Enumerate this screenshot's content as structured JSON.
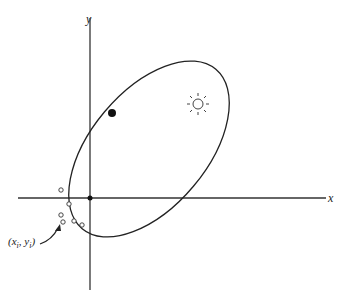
{
  "diagram": {
    "axes": {
      "x_label": "x",
      "y_label": "y"
    },
    "annotation": {
      "point_label": "(x",
      "sub_i1": "i",
      "comma": ", y",
      "sub_i2": "i",
      "close": ")"
    },
    "elements": {
      "orbit": "elliptical orbit",
      "sun": "sun at focus",
      "planet": "filled dot on orbit",
      "origin": "origin point",
      "observations": "observed data points (xi, yi)"
    },
    "observation_points": [
      {
        "x": 61,
        "y": 190
      },
      {
        "x": 69,
        "y": 204
      },
      {
        "x": 62,
        "y": 215
      },
      {
        "x": 64,
        "y": 222
      },
      {
        "x": 74,
        "y": 221
      },
      {
        "x": 82,
        "y": 225
      }
    ],
    "colors": {
      "stroke": "#222222",
      "background": "#ffffff"
    }
  }
}
